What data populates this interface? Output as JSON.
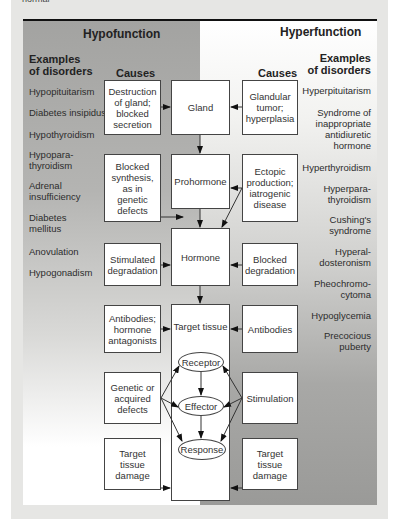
{
  "caption_fragment": "normal",
  "diagram": {
    "hypofunction": {
      "title": "Hypofunction",
      "examples_header_1": "Examples",
      "examples_header_2": "of disorders",
      "causes_header": "Causes",
      "disorders": [
        "Hypopituitarism",
        "Diabetes insipidus",
        "Hypothyroidism",
        "Hypopara-\nthyroidism",
        "Adrenal\ninsufficiency",
        "Diabetes\nmellitus",
        "Anovulation",
        "Hypogonadism"
      ],
      "causes": [
        "Destruction\nof gland;\nblocked\nsecretion",
        "Blocked\nsynthesis,\nas in\ngenetic\ndefects",
        "Stimulated\ndegradation",
        "Antibodies;\nhormone\nantagonists",
        "Genetic or\nacquired\ndefects",
        "Target\ntissue\ndamage"
      ]
    },
    "hyperfunction": {
      "title": "Hyperfunction",
      "examples_header_1": "Examples",
      "examples_header_2": "of disorders",
      "causes_header": "Causes",
      "disorders": [
        "Hyperpituitarism",
        "Syndrome of\ninappropriate\nantidiuretic\nhormone",
        "Hyperthyroidism",
        "Hyperpara-\nthyroidism",
        "Cushing's\nsyndrome",
        "Hyperal-\ndosteronism",
        "Pheochromo-\ncytoma",
        "Hypoglycemia",
        "Precocious\npuberty"
      ],
      "causes": [
        "Glandular\ntumor;\nhyperplasia",
        "Ectopic\nproduction;\niatrogenic\ndisease",
        "Blocked\ndegradation",
        "Antibodies",
        "Stimulation",
        "Target\ntissue\ndamage"
      ]
    },
    "pathway": {
      "gland": "Gland",
      "prohormone": "Prohormone",
      "hormone": "Hormone",
      "target_tissue": "Target tissue",
      "receptor": "Receptor",
      "effector": "Effector",
      "response": "Response"
    }
  }
}
